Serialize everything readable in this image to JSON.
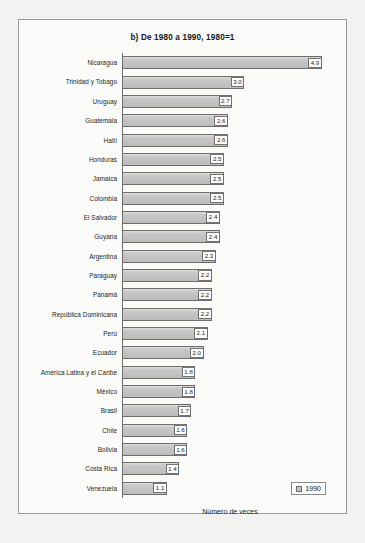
{
  "chart_data": {
    "type": "bar",
    "orientation": "horizontal",
    "title": "b) De 1980 a 1990, 1980=1",
    "xlabel": "Número de veces",
    "ylabel": "",
    "xlim": [
      0,
      5.3
    ],
    "grid": false,
    "legend": {
      "position": "bottom-right",
      "entries": [
        {
          "label": "1990",
          "color": "#c0c0c0"
        }
      ]
    },
    "value_format": "one-decimal",
    "categories": [
      "Nicaragua",
      "Trinidad y Tobago",
      "Uruguay",
      "Guatemala",
      "Haití",
      "Honduras",
      "Jamaica",
      "Colombia",
      "El Salvador",
      "Guyana",
      "Argentina",
      "Paraguay",
      "Panamá",
      "República Dominicana",
      "Perú",
      "Ecuador",
      "América Latina y el Caribe",
      "México",
      "Brasil",
      "Chile",
      "Bolivia",
      "Costa Rica",
      "Venezuela"
    ],
    "values": [
      4.9,
      3.0,
      2.7,
      2.6,
      2.6,
      2.5,
      2.5,
      2.5,
      2.4,
      2.4,
      2.3,
      2.2,
      2.2,
      2.2,
      2.1,
      2.0,
      1.8,
      1.8,
      1.7,
      1.6,
      1.6,
      1.4,
      1.1
    ],
    "value_labels": [
      "4.9",
      "3.0",
      "2.7",
      "2.6",
      "2.6",
      "2.5",
      "2.5",
      "2.5",
      "2.4",
      "2.4",
      "2.3",
      "2.2",
      "2.2",
      "2.2",
      "2.1",
      "2.0",
      "1.8",
      "1.8",
      "1.7",
      "1.6",
      "1.6",
      "1.4",
      "1.1"
    ],
    "series": [
      {
        "name": "1990",
        "values": [
          4.9,
          3.0,
          2.7,
          2.6,
          2.6,
          2.5,
          2.5,
          2.5,
          2.4,
          2.4,
          2.3,
          2.2,
          2.2,
          2.2,
          2.1,
          2.0,
          1.8,
          1.8,
          1.7,
          1.6,
          1.6,
          1.4,
          1.1
        ]
      }
    ]
  },
  "colors": {
    "bar_fill": "#c0c0c0",
    "bar_border": "#6e6e6e",
    "frame_border": "#9a9a9a",
    "plot_background": "#fbfbfa",
    "page_background": "#f2f2f0",
    "text": "#15181c"
  }
}
